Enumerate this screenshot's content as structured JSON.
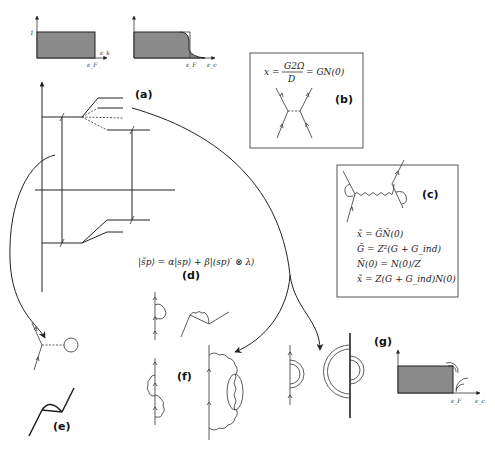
{
  "diagram": {
    "top_plots": {
      "left": {
        "y_tick": "1",
        "x_label": "ε_F",
        "x_axis_label": "ε_k"
      },
      "right": {
        "x_tick": "ε_F",
        "x_axis_label": "ε_c"
      }
    },
    "panels": {
      "a": {
        "label": "(a)"
      },
      "b": {
        "label": "(b)",
        "equation": "x = G2Ω / D = GN(0)",
        "eq_lhs": "x =",
        "eq_num": "G2Ω",
        "eq_den": "D",
        "eq_rhs": "= GN(0)"
      },
      "c": {
        "label": "(c)",
        "equations": [
          "x̃ = G̃Ñ(0)",
          "G̃ = Z²(G + G_ind)",
          "Ñ(0) = N(0)/Z",
          "x̃ = Z(G + G_ind)N(0)"
        ]
      },
      "d": {
        "label": "(d)",
        "equation": "|s̃p⟩ = α|sp⟩ + β|(sp)′ ⊗ λ⟩"
      },
      "e": {
        "label": "(e)"
      },
      "f": {
        "label": "(f)"
      },
      "g": {
        "label": "(g)",
        "x_tick": "ε_F",
        "x_axis_label": "ε_c"
      }
    },
    "colors": {
      "line": "#222222",
      "fill": "#8a8a8a",
      "box_border": "#555555",
      "background": "#ffffff"
    }
  }
}
